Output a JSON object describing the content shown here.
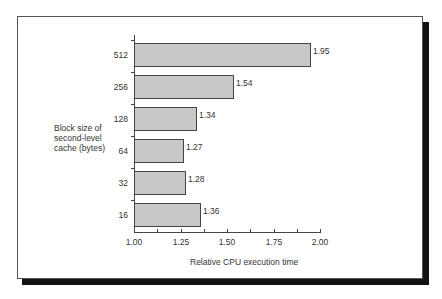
{
  "chart_data": {
    "type": "bar",
    "orientation": "horizontal",
    "title": "",
    "xlabel": "Relative CPU execution time",
    "ylabel": "Block size of second-level cache (bytes)",
    "ylabel_lines": [
      "Block size of",
      "second-level",
      "cache (bytes)"
    ],
    "categories": [
      "512",
      "256",
      "128",
      "64",
      "32",
      "16"
    ],
    "values": [
      1.95,
      1.54,
      1.34,
      1.27,
      1.28,
      1.36
    ],
    "value_labels": [
      "1.95",
      "1.54",
      "1.34",
      "1.27",
      "1.28",
      "1.36"
    ],
    "xlim": [
      1.0,
      2.0
    ],
    "xticks": [
      "1.00",
      "1.25",
      "1.50",
      "1.75",
      "2.00"
    ],
    "grid": false,
    "bar_color": "#c8c8c8"
  }
}
